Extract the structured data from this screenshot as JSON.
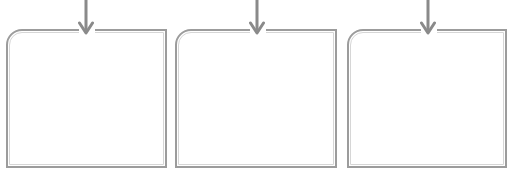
{
  "diagram": {
    "panels": [
      {
        "id": "panel-1",
        "left": 6,
        "width": 161,
        "arrow_icon": "down-arrow-icon"
      },
      {
        "id": "panel-2",
        "left": 175,
        "width": 162,
        "arrow_icon": "down-arrow-icon"
      },
      {
        "id": "panel-3",
        "left": 347,
        "width": 160,
        "arrow_icon": "down-arrow-icon"
      }
    ],
    "colors": {
      "border_outer": "#9c9c9c",
      "border_inner": "#d6d6d6",
      "arrow": "#8a8a8a",
      "background": "#ffffff"
    }
  }
}
